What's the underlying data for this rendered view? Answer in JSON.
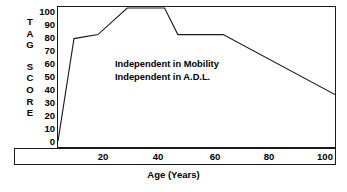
{
  "chart_data": {
    "type": "line",
    "title": "",
    "subtitle": "",
    "xlabel": "Age (Years)",
    "ylabel": "TAG SCORE",
    "ylabel_letters_group_1": [
      "T",
      "A",
      "G"
    ],
    "ylabel_letters_group_2": [
      "S",
      "C",
      "O",
      "R",
      "E"
    ],
    "xlim": [
      0,
      104
    ],
    "ylim": [
      0,
      100
    ],
    "xticks": [
      20,
      40,
      60,
      80,
      100
    ],
    "xtick_labels": [
      "20",
      "40",
      "60",
      "80",
      "100"
    ],
    "yticks": [
      0,
      10,
      20,
      30,
      40,
      50,
      60,
      70,
      80,
      90,
      100
    ],
    "ytick_labels": [
      "100",
      "90",
      "80",
      "70",
      "60",
      "50",
      "40",
      "30",
      "20",
      "10",
      "0"
    ],
    "grid": false,
    "legend": null,
    "line_color": "#1a1a1a",
    "series": [
      {
        "name": "TAG Score",
        "x": [
          0,
          6,
          15,
          26,
          40,
          45,
          62,
          104
        ],
        "y": [
          0,
          77,
          80,
          100,
          100,
          80,
          80,
          35
        ]
      }
    ],
    "annotations": [
      {
        "text": "Independent in Mobility",
        "x": 20,
        "y": 62
      },
      {
        "text": "Independent in A.D.L.",
        "x": 20,
        "y": 52
      }
    ]
  },
  "axis": {
    "y_title_group_1": "T\nA\nG",
    "y_title_group_2": "S\nC\nO\nR\nE",
    "x_title": "Age (Years)"
  },
  "ylabels": [
    "100",
    "90",
    "80",
    "70",
    "60",
    "50",
    "40",
    "30",
    "20",
    "10",
    "0"
  ],
  "xlabels": [
    "20",
    "40",
    "60",
    "80",
    "100"
  ],
  "annotations": {
    "line1": "Independent in Mobility",
    "line2": "Independent in A.D.L."
  },
  "colors": {
    "line": "#1a1a1a",
    "frame": "#1a1a1a",
    "background": "#ffffff",
    "text": "#000000"
  }
}
